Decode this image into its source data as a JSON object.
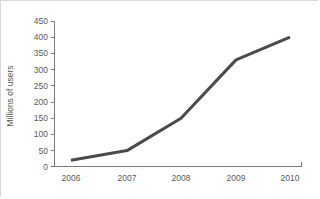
{
  "chart_data": {
    "type": "line",
    "title": "",
    "xlabel": "",
    "ylabel": "Millions of users",
    "categories": [
      "2006",
      "2007",
      "2008",
      "2009",
      "2010"
    ],
    "values": [
      20,
      50,
      150,
      330,
      400
    ],
    "series": [
      {
        "name": "Users",
        "values": [
          20,
          50,
          150,
          330,
          400
        ],
        "color": "#4a4a4a"
      }
    ],
    "ylim": [
      0,
      450
    ],
    "ytick_step": 50,
    "ytick_labels": [
      "0",
      "50",
      "100",
      "150",
      "200",
      "250",
      "300",
      "350",
      "400",
      "450"
    ],
    "ytick_values": [
      0,
      50,
      100,
      150,
      200,
      250,
      300,
      350,
      400,
      450
    ],
    "xtick_labels": [
      "2006",
      "2007",
      "2008",
      "2009",
      "2010"
    ],
    "grid": false,
    "legend": false,
    "legend_position": "none",
    "colors": {
      "line": "#4a4a4a",
      "axis": "#7a7a7a",
      "text": "#5a5a5a",
      "background": "#ffffff",
      "border": "#d8d8d8"
    }
  }
}
